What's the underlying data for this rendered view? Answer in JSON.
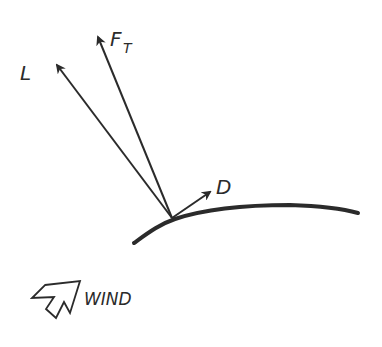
{
  "diagram": {
    "labels": {
      "lift": "L",
      "total_force_main": "F",
      "total_force_sub": "T",
      "drag": "D",
      "wind": "WIND"
    },
    "colors": {
      "ink": "#2b2b2b",
      "background": "#ffffff"
    },
    "vectors": [
      {
        "name": "lift",
        "label": "L",
        "from": [
          172,
          218
        ],
        "to": [
          56,
          63
        ]
      },
      {
        "name": "total-force",
        "label": "F_T",
        "from": [
          172,
          218
        ],
        "to": [
          97,
          35
        ]
      },
      {
        "name": "drag",
        "label": "D",
        "from": [
          172,
          218
        ],
        "to": [
          211,
          191
        ]
      }
    ]
  }
}
